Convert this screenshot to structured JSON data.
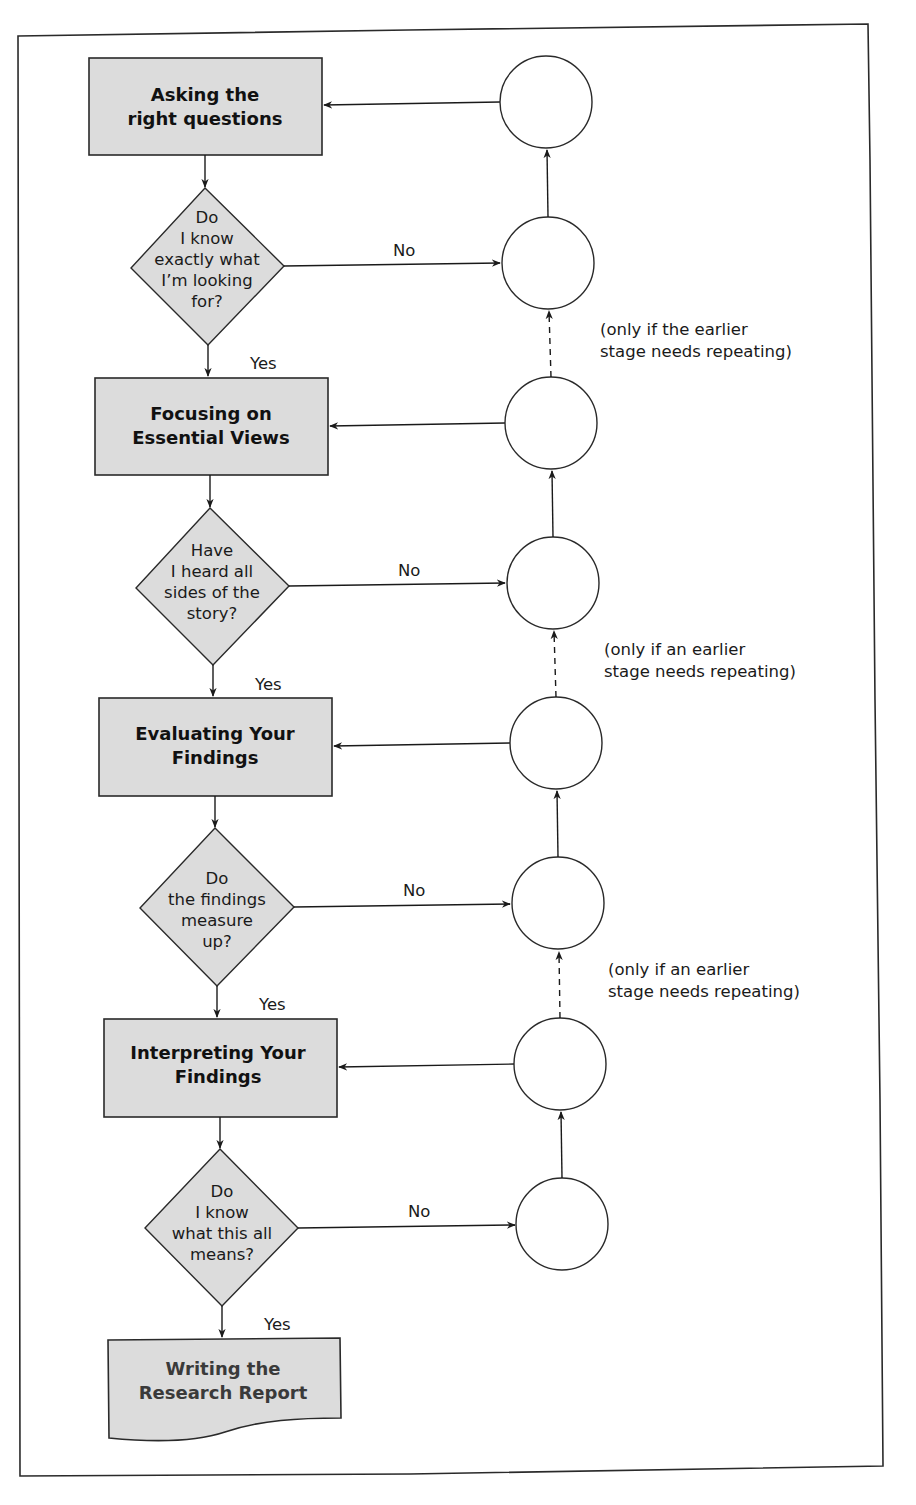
{
  "colors": {
    "box_fill": "#dcdcdc",
    "diamond_fill": "#dcdcdc",
    "stroke": "#2a2a2a",
    "background": "#ffffff"
  },
  "stages": [
    {
      "id": "s1",
      "lines": [
        "Asking the",
        "right questions"
      ]
    },
    {
      "id": "s2",
      "lines": [
        "Focusing on",
        "Essential Views"
      ]
    },
    {
      "id": "s3",
      "lines": [
        "Evaluating Your",
        "Findings"
      ]
    },
    {
      "id": "s4",
      "lines": [
        "Interpreting Your",
        "Findings"
      ]
    }
  ],
  "final_stage": {
    "lines": [
      "Writing the",
      "Research Report"
    ]
  },
  "decisions": [
    {
      "id": "d1",
      "lines": [
        "Do",
        "I know",
        "exactly what",
        "I’m looking",
        "for?"
      ]
    },
    {
      "id": "d2",
      "lines": [
        "Have",
        "I heard all",
        "sides of the",
        "story?"
      ]
    },
    {
      "id": "d3",
      "lines": [
        "Do",
        "the findings",
        "measure",
        "up?"
      ]
    },
    {
      "id": "d4",
      "lines": [
        "Do",
        "I know",
        "what this all",
        "means?"
      ]
    }
  ],
  "edge_labels": {
    "yes": "Yes",
    "no": "No"
  },
  "notes": [
    {
      "lines": [
        "(only if the earlier",
        "stage needs repeating)"
      ]
    },
    {
      "lines": [
        "(only if an earlier",
        "stage needs repeating)"
      ]
    },
    {
      "lines": [
        "(only if an earlier",
        "stage needs repeating)"
      ]
    }
  ]
}
